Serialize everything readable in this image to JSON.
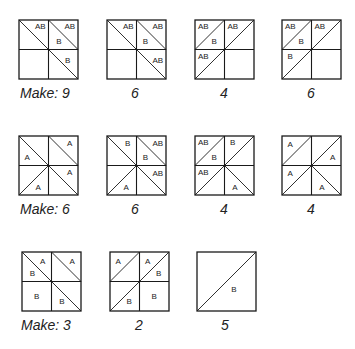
{
  "rows": [
    {
      "blocks": [
        {
          "x": 18,
          "y": 19,
          "caption": "Make: 9",
          "caption_x": 20,
          "caption_y": 85,
          "diagonals": [
            [
              0,
              0,
              1,
              1
            ],
            [
              1,
              0,
              2,
              1
            ],
            [
              1,
              1,
              2,
              2
            ]
          ],
          "labels": [
            {
              "t": "AB",
              "x": 0.72,
              "y": 0.22
            },
            {
              "t": "AB",
              "x": 1.72,
              "y": 0.22
            },
            {
              "t": "B",
              "x": 1.35,
              "y": 0.7
            },
            {
              "t": "B",
              "x": 1.65,
              "y": 1.35
            }
          ]
        },
        {
          "x": 106,
          "y": 19,
          "caption": "6",
          "caption_x": 131,
          "caption_y": 85,
          "diagonals": [
            [
              0,
              0,
              1,
              1
            ],
            [
              1,
              0,
              2,
              1
            ],
            [
              1,
              1,
              2,
              2
            ]
          ],
          "labels": [
            {
              "t": "AB",
              "x": 0.72,
              "y": 0.22
            },
            {
              "t": "AB",
              "x": 1.72,
              "y": 0.22
            },
            {
              "t": "B",
              "x": 1.3,
              "y": 0.72
            },
            {
              "t": "AB",
              "x": 1.72,
              "y": 1.35
            }
          ]
        },
        {
          "x": 194,
          "y": 19,
          "caption": "4",
          "caption_x": 220,
          "caption_y": 85,
          "diagonals": [
            [
              0,
              1,
              1,
              0
            ],
            [
              1,
              1,
              2,
              0
            ],
            [
              0,
              2,
              1,
              1
            ]
          ],
          "labels": [
            {
              "t": "AB",
              "x": 0.28,
              "y": 0.22
            },
            {
              "t": "B",
              "x": 0.65,
              "y": 0.72
            },
            {
              "t": "AB",
              "x": 1.28,
              "y": 0.22
            },
            {
              "t": "AB",
              "x": 0.28,
              "y": 1.22
            }
          ]
        },
        {
          "x": 281,
          "y": 19,
          "caption": "6",
          "caption_x": 307,
          "caption_y": 85,
          "diagonals": [
            [
              0,
              1,
              1,
              0
            ],
            [
              1,
              1,
              2,
              0
            ],
            [
              0,
              2,
              1,
              1
            ]
          ],
          "labels": [
            {
              "t": "AB",
              "x": 0.28,
              "y": 0.22
            },
            {
              "t": "B",
              "x": 0.65,
              "y": 0.72
            },
            {
              "t": "AB",
              "x": 1.28,
              "y": 0.22
            },
            {
              "t": "B",
              "x": 0.28,
              "y": 1.22
            }
          ]
        }
      ]
    },
    {
      "blocks": [
        {
          "x": 18,
          "y": 135,
          "caption": "Make: 6",
          "caption_x": 20,
          "caption_y": 201,
          "diagonals": [
            [
              0,
              0,
              1,
              1
            ],
            [
              1,
              0,
              2,
              1
            ],
            [
              0,
              2,
              1,
              1
            ],
            [
              1,
              1,
              2,
              2
            ]
          ],
          "labels": [
            {
              "t": "A",
              "x": 0.28,
              "y": 0.72
            },
            {
              "t": "A",
              "x": 1.72,
              "y": 0.25
            },
            {
              "t": "A",
              "x": 1.72,
              "y": 1.22
            },
            {
              "t": "A",
              "x": 0.65,
              "y": 1.72
            }
          ]
        },
        {
          "x": 106,
          "y": 135,
          "caption": "6",
          "caption_x": 131,
          "caption_y": 201,
          "diagonals": [
            [
              0,
              0,
              1,
              1
            ],
            [
              1,
              0,
              2,
              1
            ],
            [
              0,
              2,
              1,
              1
            ],
            [
              1,
              1,
              2,
              2
            ]
          ],
          "labels": [
            {
              "t": "B",
              "x": 0.7,
              "y": 0.25
            },
            {
              "t": "AB",
              "x": 1.72,
              "y": 0.25
            },
            {
              "t": "B",
              "x": 1.3,
              "y": 0.72
            },
            {
              "t": "AB",
              "x": 1.72,
              "y": 1.25
            },
            {
              "t": "A",
              "x": 0.65,
              "y": 1.72
            }
          ]
        },
        {
          "x": 194,
          "y": 135,
          "caption": "4",
          "caption_x": 220,
          "caption_y": 201,
          "diagonals": [
            [
              0,
              1,
              1,
              0
            ],
            [
              1,
              1,
              2,
              0
            ],
            [
              0,
              2,
              1,
              1
            ],
            [
              1,
              1,
              2,
              2
            ]
          ],
          "labels": [
            {
              "t": "AB",
              "x": 0.28,
              "y": 0.22
            },
            {
              "t": "B",
              "x": 0.65,
              "y": 0.72
            },
            {
              "t": "B",
              "x": 1.28,
              "y": 0.22
            },
            {
              "t": "AB",
              "x": 0.28,
              "y": 1.22
            },
            {
              "t": "A",
              "x": 1.35,
              "y": 1.72
            }
          ]
        },
        {
          "x": 281,
          "y": 135,
          "caption": "4",
          "caption_x": 307,
          "caption_y": 201,
          "diagonals": [
            [
              0,
              1,
              1,
              0
            ],
            [
              1,
              1,
              2,
              0
            ],
            [
              0,
              2,
              1,
              1
            ],
            [
              1,
              1,
              2,
              2
            ]
          ],
          "labels": [
            {
              "t": "A",
              "x": 0.28,
              "y": 0.28
            },
            {
              "t": "A",
              "x": 1.72,
              "y": 0.72
            },
            {
              "t": "A",
              "x": 0.28,
              "y": 1.25
            },
            {
              "t": "A",
              "x": 1.35,
              "y": 1.72
            }
          ]
        }
      ]
    },
    {
      "blocks": [
        {
          "x": 21,
          "y": 251,
          "caption": "Make: 3",
          "caption_x": 21,
          "caption_y": 317,
          "diagonals": [
            [
              0,
              0,
              1,
              1
            ],
            [
              1,
              0,
              2,
              1
            ],
            [
              1,
              1,
              2,
              2
            ]
          ],
          "labels": [
            {
              "t": "A",
              "x": 0.7,
              "y": 0.3
            },
            {
              "t": "B",
              "x": 0.35,
              "y": 0.7
            },
            {
              "t": "A",
              "x": 1.7,
              "y": 0.3
            },
            {
              "t": "B",
              "x": 0.5,
              "y": 1.5
            },
            {
              "t": "B",
              "x": 1.35,
              "y": 1.65
            }
          ]
        },
        {
          "x": 109,
          "y": 251,
          "caption": "2",
          "caption_x": 135,
          "caption_y": 317,
          "diagonals": [
            [
              0,
              1,
              1,
              0
            ],
            [
              1,
              1,
              2,
              0
            ],
            [
              0,
              2,
              1,
              1
            ]
          ],
          "labels": [
            {
              "t": "A",
              "x": 0.28,
              "y": 0.3
            },
            {
              "t": "A",
              "x": 1.28,
              "y": 0.3
            },
            {
              "t": "B",
              "x": 1.65,
              "y": 0.7
            },
            {
              "t": "B",
              "x": 0.65,
              "y": 1.65
            },
            {
              "t": "B",
              "x": 1.5,
              "y": 1.5
            }
          ]
        },
        {
          "x": 196,
          "y": 251,
          "caption": "5",
          "caption_x": 221,
          "caption_y": 317,
          "single": true,
          "diagonals": [
            [
              0,
              2,
              2,
              0
            ]
          ],
          "labels": [
            {
              "t": "B",
              "x": 1.25,
              "y": 1.25
            }
          ]
        }
      ]
    }
  ]
}
